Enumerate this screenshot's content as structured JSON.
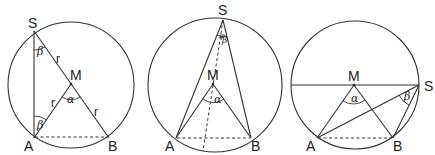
{
  "figures": [
    {
      "id": "fig1",
      "labels": {
        "S": "S",
        "M": "M",
        "A": "A",
        "B": "B"
      },
      "radius_labels": [
        "r",
        "r",
        "r"
      ],
      "angles": {
        "beta_top": "β",
        "beta_bottom": "β",
        "alpha": "α"
      }
    },
    {
      "id": "fig2",
      "labels": {
        "S": "S",
        "M": "M",
        "A": "A",
        "B": "B"
      },
      "angles": {
        "phi": "φ",
        "beta": "β",
        "alpha": "α"
      }
    },
    {
      "id": "fig3",
      "labels": {
        "S": "S",
        "M": "M",
        "A": "A",
        "B": "B"
      },
      "angles": {
        "beta": "β",
        "alpha": "α"
      }
    }
  ]
}
